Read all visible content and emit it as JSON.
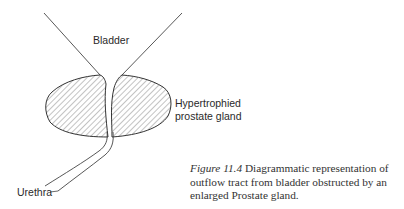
{
  "diagram": {
    "labels": {
      "bladder": "Bladder",
      "prostate_line1": "Hypertrophied",
      "prostate_line2": "prostate gland",
      "urethra": "Urethra"
    },
    "caption": {
      "figure_label": "Figure 11.4",
      "text_line1": " Diagrammatic representation of",
      "text_line2": "outflow tract from bladder obstructed by an",
      "text_line3": "enlarged Prostate gland."
    },
    "colors": {
      "stroke": "#333333",
      "hatch": "#6a6a6a",
      "background": "#ffffff"
    }
  }
}
